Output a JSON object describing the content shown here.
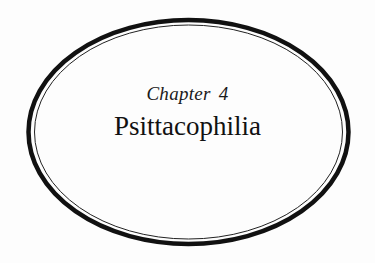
{
  "chapter": {
    "label": "Chapter 4",
    "title": "Psittacophilia"
  },
  "colors": {
    "ink": "#111111",
    "paper": "#fdfdfd"
  }
}
